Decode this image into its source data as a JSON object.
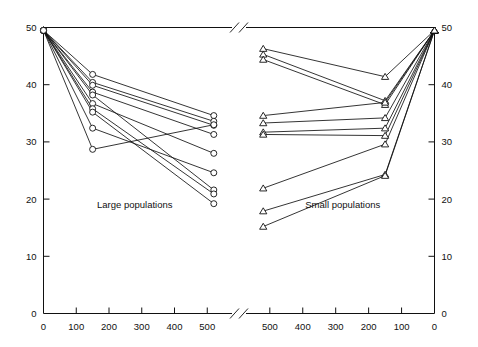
{
  "chart_data": {
    "type": "line",
    "title": "",
    "subtitle": "",
    "xlabel": "",
    "ylabel": "",
    "grid": false,
    "legend_position": "none",
    "annotations": [
      "Large populations",
      "Small populations"
    ],
    "axis_break": true,
    "panels": [
      {
        "name": "left-panel",
        "caption": "Large populations",
        "marker": "circle",
        "x_axis": {
          "ticks": [
            0,
            100,
            200,
            300,
            400,
            500
          ],
          "tick_labels": [
            "0",
            "100",
            "200",
            "300",
            "400",
            "500"
          ],
          "xlim": [
            0,
            545
          ],
          "direction": "normal",
          "label_side": "bottom"
        },
        "y_axis": {
          "ticks": [
            0,
            10,
            20,
            30,
            40,
            50
          ],
          "tick_labels": [
            "0",
            "10",
            "20",
            "30",
            "40",
            "50"
          ],
          "ylim": [
            0,
            50
          ],
          "label_side": "left"
        },
        "series": [
          {
            "name": "L1",
            "x": [
              0,
              150,
              520
            ],
            "values": [
              49.5,
              41.8,
              34.6
            ]
          },
          {
            "name": "L2",
            "x": [
              0,
              150,
              520
            ],
            "values": [
              49.5,
              40.4,
              33.6
            ]
          },
          {
            "name": "L3",
            "x": [
              0,
              150,
              520
            ],
            "values": [
              49.5,
              39.9,
              32.9
            ]
          },
          {
            "name": "L4",
            "x": [
              0,
              150,
              520
            ],
            "values": [
              49.5,
              38.7,
              31.3
            ]
          },
          {
            "name": "L5",
            "x": [
              0,
              150,
              520
            ],
            "values": [
              49.5,
              38.2,
              21.6
            ]
          },
          {
            "name": "L6",
            "x": [
              0,
              150,
              520
            ],
            "values": [
              49.5,
              36.7,
              28.0
            ]
          },
          {
            "name": "L7",
            "x": [
              0,
              150,
              520
            ],
            "values": [
              49.5,
              35.8,
              20.9
            ]
          },
          {
            "name": "L8",
            "x": [
              0,
              150,
              520
            ],
            "values": [
              49.5,
              35.2,
              19.2
            ]
          },
          {
            "name": "L9",
            "x": [
              0,
              150,
              520
            ],
            "values": [
              49.5,
              32.4,
              24.6
            ]
          },
          {
            "name": "L10",
            "x": [
              0,
              150,
              520
            ],
            "values": [
              49.5,
              28.7,
              33.0
            ]
          }
        ]
      },
      {
        "name": "right-panel",
        "caption": "Small populations",
        "marker": "triangle",
        "x_axis": {
          "ticks": [
            500,
            400,
            300,
            200,
            100,
            0
          ],
          "tick_labels": [
            "500",
            "400",
            "300",
            "200",
            "100",
            "0"
          ],
          "xlim": [
            545,
            0
          ],
          "direction": "reversed",
          "label_side": "bottom"
        },
        "y_axis": {
          "ticks": [
            0,
            10,
            20,
            30,
            40,
            50
          ],
          "tick_labels": [
            "0",
            "10",
            "20",
            "30",
            "40",
            "50"
          ],
          "ylim": [
            0,
            50
          ],
          "label_side": "right"
        },
        "series": [
          {
            "name": "S1",
            "x": [
              520,
              150,
              0
            ],
            "values": [
              46.3,
              41.4,
              49.5
            ]
          },
          {
            "name": "S2",
            "x": [
              520,
              150,
              0
            ],
            "values": [
              45.3,
              37.2,
              49.5
            ]
          },
          {
            "name": "S3",
            "x": [
              520,
              150,
              0
            ],
            "values": [
              44.4,
              36.5,
              49.5
            ]
          },
          {
            "name": "S4",
            "x": [
              520,
              150,
              0
            ],
            "values": [
              34.6,
              36.9,
              49.5
            ]
          },
          {
            "name": "S5",
            "x": [
              520,
              150,
              0
            ],
            "values": [
              33.3,
              34.2,
              49.5
            ]
          },
          {
            "name": "S6",
            "x": [
              520,
              150,
              0
            ],
            "values": [
              31.7,
              32.4,
              49.5
            ]
          },
          {
            "name": "S7",
            "x": [
              520,
              150,
              0
            ],
            "values": [
              31.3,
              31.1,
              49.5
            ]
          },
          {
            "name": "S8",
            "x": [
              520,
              150,
              0
            ],
            "values": [
              21.9,
              29.6,
              49.5
            ]
          },
          {
            "name": "S9",
            "x": [
              520,
              150,
              0
            ],
            "values": [
              17.9,
              24.3,
              49.5
            ]
          },
          {
            "name": "S10",
            "x": [
              520,
              150,
              0
            ],
            "values": [
              15.2,
              24.1,
              49.5
            ]
          }
        ]
      }
    ]
  }
}
